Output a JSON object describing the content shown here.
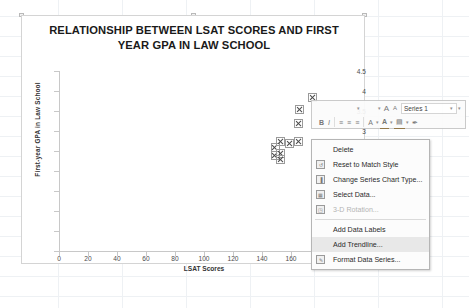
{
  "chart_data": {
    "type": "scatter",
    "title": "RELATIONSHIP BETWEEN LSAT SCORES AND FIRST YEAR GPA IN LAW SCHOOL",
    "title_line1": "RELATIONSHIP BETWEEN LSAT SCORES AND FIRST",
    "title_line2": "YEAR GPA IN LAW SCHOOL",
    "xlabel": "LSAT Scores",
    "ylabel": "First-year GPA in Law School",
    "xlim": [
      0,
      200
    ],
    "ylim": [
      0,
      4.5
    ],
    "xticks": [
      0,
      20,
      40,
      60,
      80,
      100,
      120,
      140,
      160,
      180,
      200
    ],
    "yticks": [
      0,
      0.5,
      1,
      1.5,
      2,
      2.5,
      3,
      3.5,
      4,
      4.5
    ],
    "grid": false,
    "legend": false,
    "series_name": "Series 1",
    "marker": "x-cross",
    "points": [
      {
        "x": 149,
        "y": 2.6
      },
      {
        "x": 149,
        "y": 2.4
      },
      {
        "x": 153,
        "y": 2.75
      },
      {
        "x": 153,
        "y": 2.45
      },
      {
        "x": 153,
        "y": 2.3
      },
      {
        "x": 159,
        "y": 2.7
      },
      {
        "x": 165,
        "y": 2.75
      },
      {
        "x": 165,
        "y": 3.2
      },
      {
        "x": 166,
        "y": 3.55
      },
      {
        "x": 175,
        "y": 3.85
      }
    ]
  },
  "mini_toolbar": {
    "font_size_caret": "▾",
    "grow_font": "A",
    "shrink_font": "A",
    "series_label": "Series 1",
    "series_caret": "▾",
    "bold": "B",
    "italic": "I",
    "align_left": "≡",
    "align_center": "≡",
    "align_right": "≡",
    "font_color_letter": "A",
    "highlight_letter": "A",
    "fill_letter": "▤",
    "format_painter": "✒"
  },
  "context_menu": {
    "items": [
      {
        "label": "Delete",
        "icon": "",
        "has_icon": false,
        "disabled": false,
        "highlight": false,
        "separator_after": false
      },
      {
        "label": "Reset to Match Style",
        "icon": "↺",
        "has_icon": true,
        "disabled": false,
        "highlight": false,
        "separator_after": false
      },
      {
        "label": "Change Series Chart Type...",
        "icon": "▐",
        "has_icon": true,
        "disabled": false,
        "highlight": false,
        "separator_after": false
      },
      {
        "label": "Select Data...",
        "icon": "▦",
        "has_icon": true,
        "disabled": false,
        "highlight": false,
        "separator_after": false
      },
      {
        "label": "3-D Rotation...",
        "icon": "◳",
        "has_icon": true,
        "disabled": true,
        "highlight": false,
        "separator_after": true
      },
      {
        "label": "Add Data Labels",
        "icon": "",
        "has_icon": false,
        "disabled": false,
        "highlight": false,
        "separator_after": false
      },
      {
        "label": "Add Trendline...",
        "icon": "",
        "has_icon": false,
        "disabled": false,
        "highlight": true,
        "separator_after": false
      },
      {
        "label": "Format Data Series...",
        "icon": "✎",
        "has_icon": true,
        "disabled": false,
        "highlight": false,
        "separator_after": false
      }
    ]
  },
  "colors": {
    "marker": "#6b6b6b",
    "axis": "#c8c8c8",
    "chart_border": "#d4d4d4",
    "menu_highlight": "#e8e8e8",
    "grid": "#eef1f4"
  }
}
